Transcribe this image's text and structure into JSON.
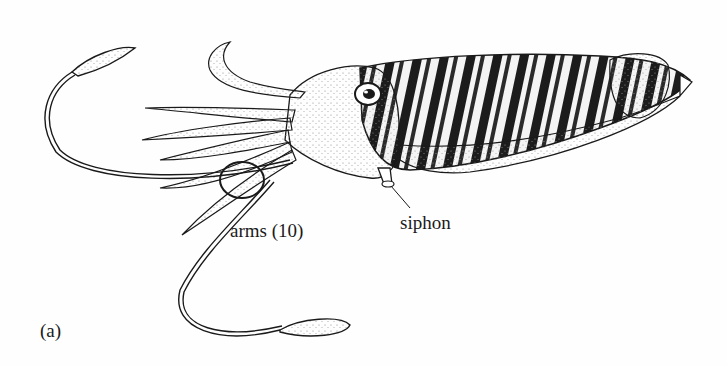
{
  "figure": {
    "panel_label": "(a)",
    "labels": {
      "arms": "arms (10)",
      "siphon": "siphon"
    }
  },
  "colors": {
    "ink": "#1a1a1a",
    "background": "#fefefe",
    "stipple": "#9a9a9a"
  }
}
